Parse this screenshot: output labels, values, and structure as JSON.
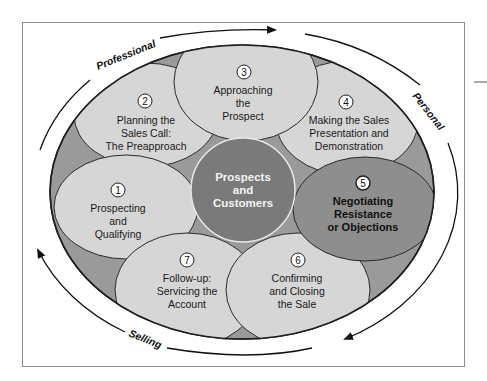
{
  "diagram": {
    "type": "sales-process-cycle",
    "colors": {
      "background": "#ffffff",
      "frame": "#8a8a8a",
      "outer_ring": "#9a9a9a",
      "step_fill": "#d6d6d6",
      "highlight_fill": "#8e8e8e",
      "center_fill": "#7a7a7a",
      "center_text": "#f4f4f4",
      "stroke": "#1e1e1e"
    },
    "center": {
      "line1": "Prospects",
      "line2": "and",
      "line3": "Customers"
    },
    "steps": [
      {
        "num": "1",
        "lines": [
          "Prospecting",
          "and",
          "Qualifying"
        ]
      },
      {
        "num": "2",
        "lines": [
          "Planning the",
          "Sales Call:",
          "The Preapproach"
        ]
      },
      {
        "num": "3",
        "lines": [
          "Approaching",
          "the",
          "Prospect"
        ]
      },
      {
        "num": "4",
        "lines": [
          "Making the Sales",
          "Presentation and",
          "Demonstration"
        ]
      },
      {
        "num": "5",
        "lines": [
          "Negotiating",
          "Resistance",
          "or Objections"
        ],
        "highlighted": true
      },
      {
        "num": "6",
        "lines": [
          "Confirming",
          "and Closing",
          "the Sale"
        ]
      },
      {
        "num": "7",
        "lines": [
          "Follow-up:",
          "Servicing the",
          "Account"
        ]
      }
    ],
    "arc_labels": {
      "top_left": "Professional",
      "right": "Personal",
      "bottom": "Selling"
    }
  }
}
